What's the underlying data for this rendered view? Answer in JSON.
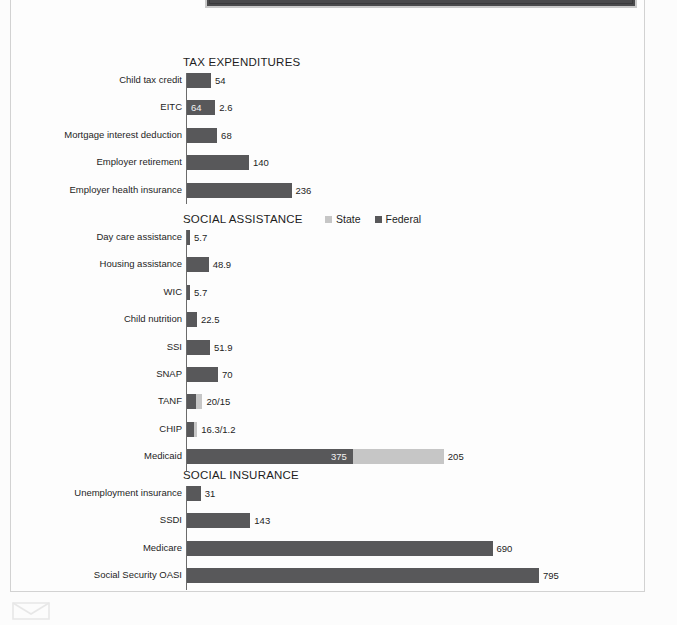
{
  "document": {
    "banner_label": "page-header-band",
    "mail_icon": "envelope-icon"
  },
  "legend": {
    "state_label": "State",
    "federal_label": "Federal",
    "state_color": "#c6c6c6",
    "federal_color": "#58585a"
  },
  "chart_data": {
    "type": "bar",
    "orientation": "horizontal",
    "title": "",
    "xlabel": "",
    "ylabel": "",
    "grid": false,
    "legend_position": "top-right of middle panel",
    "series_names": [
      "Federal",
      "State"
    ],
    "colors": {
      "Federal": "#58585a",
      "State": "#c6c6c6"
    },
    "panels": [
      {
        "title": "TAX EXPENDITURES",
        "categories": [
          "Child tax credit",
          "EITC",
          "Mortgage interest deduction",
          "Employer retirement",
          "Employer health insurance"
        ],
        "rows": [
          {
            "label": "Child tax credit",
            "federal": 54,
            "state": 0,
            "value_label": "54",
            "inside_label": ""
          },
          {
            "label": "EITC",
            "federal": 64,
            "state": 0,
            "value_label": "2.6",
            "inside_label": "64"
          },
          {
            "label": "Mortgage interest deduction",
            "federal": 68,
            "state": 0,
            "value_label": "68",
            "inside_label": ""
          },
          {
            "label": "Employer retirement",
            "federal": 140,
            "state": 0,
            "value_label": "140",
            "inside_label": ""
          },
          {
            "label": "Employer health insurance",
            "federal": 236,
            "state": 0,
            "value_label": "236",
            "inside_label": ""
          }
        ]
      },
      {
        "title": "SOCIAL ASSISTANCE",
        "categories": [
          "Day care assistance",
          "Housing assistance",
          "WIC",
          "Child nutrition",
          "SSI",
          "SNAP",
          "TANF",
          "CHIP",
          "Medicaid"
        ],
        "rows": [
          {
            "label": "Day care assistance",
            "federal": 5.7,
            "state": 0,
            "value_label": "5.7",
            "inside_label": ""
          },
          {
            "label": "Housing assistance",
            "federal": 48.9,
            "state": 0,
            "value_label": "48.9",
            "inside_label": ""
          },
          {
            "label": "WIC",
            "federal": 5.7,
            "state": 0,
            "value_label": "5.7",
            "inside_label": ""
          },
          {
            "label": "Child nutrition",
            "federal": 22.5,
            "state": 0,
            "value_label": "22.5",
            "inside_label": ""
          },
          {
            "label": "SSI",
            "federal": 51.9,
            "state": 0,
            "value_label": "51.9",
            "inside_label": ""
          },
          {
            "label": "SNAP",
            "federal": 70,
            "state": 0,
            "value_label": "70",
            "inside_label": ""
          },
          {
            "label": "TANF",
            "federal": 20,
            "state": 15,
            "value_label": "20/15",
            "inside_label": ""
          },
          {
            "label": "CHIP",
            "federal": 16.3,
            "state": 1.2,
            "value_label": "16.3/1.2",
            "inside_label": ""
          },
          {
            "label": "Medicaid",
            "federal": 375,
            "state": 205,
            "value_label": "205",
            "inside_label": "375"
          }
        ]
      },
      {
        "title": "SOCIAL INSURANCE",
        "categories": [
          "Unemployment insurance",
          "SSDI",
          "Medicare",
          "Social Security OASI"
        ],
        "rows": [
          {
            "label": "Unemployment insurance",
            "federal": 31,
            "state": 0,
            "value_label": "31",
            "inside_label": ""
          },
          {
            "label": "SSDI",
            "federal": 143,
            "state": 0,
            "value_label": "143",
            "inside_label": ""
          },
          {
            "label": "Medicare",
            "federal": 690,
            "state": 0,
            "value_label": "690",
            "inside_label": ""
          },
          {
            "label": "Social Security OASI",
            "federal": 795,
            "state": 0,
            "value_label": "795",
            "inside_label": ""
          }
        ]
      }
    ]
  },
  "layout": {
    "axis_x": 186,
    "px_per_unit": 0.4428,
    "row_height": 27.4,
    "panels_top": [
      56,
      213,
      469
    ],
    "title_left": [
      183,
      183,
      183
    ],
    "legend_left": 325
  }
}
